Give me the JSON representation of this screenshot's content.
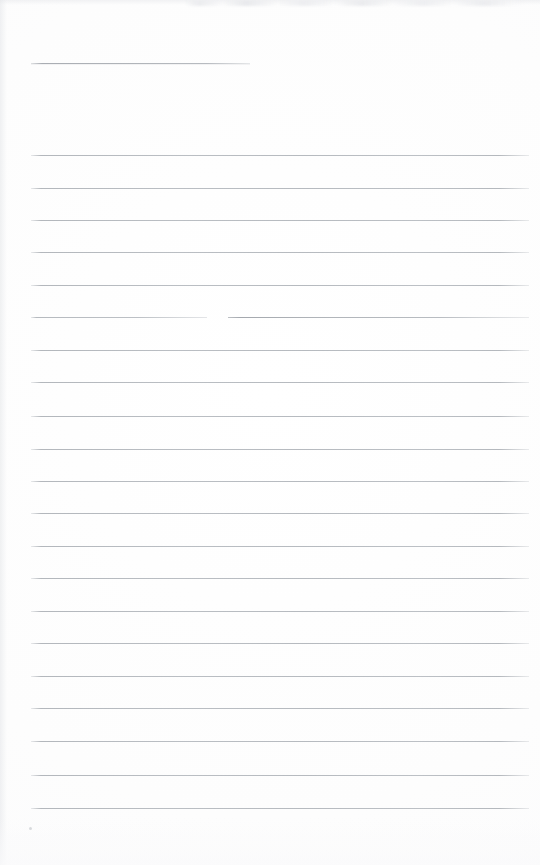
{
  "document": {
    "kind": "scanned-lined-paper",
    "title_text": "",
    "body_text": "",
    "page_width": 540,
    "page_height": 865,
    "background_color": "#fefefe",
    "rule_color": "#b9bdc2",
    "is_blank": true,
    "visible_text_count": 0
  },
  "layout": {
    "left_margin_x": 31,
    "right_margin_x": 529,
    "title_rule": {
      "y": 63,
      "x_start": 31,
      "x_end": 250,
      "length": 219
    },
    "body_rules": {
      "first_y": 155,
      "spacing": 32.35,
      "count": 21,
      "x_start": 31,
      "x_end": 529
    },
    "broken_rule": {
      "y": 317,
      "gap_x_start": 207,
      "gap_x_end": 228,
      "note": "ink skip / gap in the ruled line"
    },
    "speck_mark": {
      "x": 29,
      "y": 827,
      "size": 3
    }
  },
  "rules": [
    {
      "index": 0,
      "y": 155
    },
    {
      "index": 1,
      "y": 188
    },
    {
      "index": 2,
      "y": 220
    },
    {
      "index": 3,
      "y": 252
    },
    {
      "index": 4,
      "y": 285
    },
    {
      "index": 5,
      "y": 317,
      "broken": true
    },
    {
      "index": 6,
      "y": 350
    },
    {
      "index": 7,
      "y": 382
    },
    {
      "index": 8,
      "y": 416
    },
    {
      "index": 9,
      "y": 449
    },
    {
      "index": 10,
      "y": 481
    },
    {
      "index": 11,
      "y": 513
    },
    {
      "index": 12,
      "y": 546
    },
    {
      "index": 13,
      "y": 578
    },
    {
      "index": 14,
      "y": 611
    },
    {
      "index": 15,
      "y": 643
    },
    {
      "index": 16,
      "y": 676
    },
    {
      "index": 17,
      "y": 708
    },
    {
      "index": 18,
      "y": 741
    },
    {
      "index": 19,
      "y": 775
    },
    {
      "index": 20,
      "y": 808
    }
  ]
}
